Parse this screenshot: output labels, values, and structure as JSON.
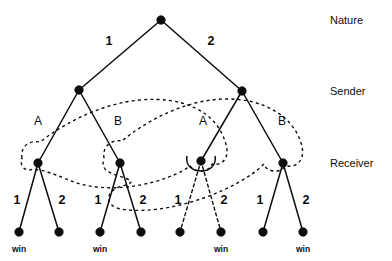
{
  "figure": {
    "type": "extensive-form-game-tree",
    "title": "",
    "background_color": "#ffffff",
    "line_color": "#0d0d0d"
  },
  "role_labels": [
    {
      "name": "nature",
      "text": "Nature",
      "x": 330,
      "y": 21
    },
    {
      "name": "sender",
      "text": "Sender",
      "x": 330,
      "y": 92
    },
    {
      "name": "receiver",
      "text": "Receiver",
      "x": 330,
      "y": 164
    }
  ],
  "nodes": {
    "root": {
      "id": "root",
      "label": "",
      "x": 161,
      "y": 20,
      "player": "Nature"
    },
    "sender": [
      {
        "id": "s1",
        "label": "",
        "x": 79,
        "y": 90,
        "player": "Sender"
      },
      {
        "id": "s2",
        "label": "",
        "x": 242,
        "y": 91,
        "player": "Sender"
      }
    ],
    "receiver": [
      {
        "id": "r1",
        "label": "",
        "x": 38,
        "y": 163,
        "player": "Receiver"
      },
      {
        "id": "r2",
        "label": "",
        "x": 120,
        "y": 163,
        "player": "Receiver"
      },
      {
        "id": "r3",
        "label": "",
        "x": 201,
        "y": 161,
        "player": "Receiver"
      },
      {
        "id": "r4",
        "label": "",
        "x": 283,
        "y": 163,
        "player": "Receiver"
      }
    ],
    "terminal": [
      {
        "id": "t1",
        "x": 19,
        "y": 232,
        "outcome": "win"
      },
      {
        "id": "t2",
        "x": 59,
        "y": 232,
        "outcome": ""
      },
      {
        "id": "t3",
        "x": 100,
        "y": 232,
        "outcome": "win"
      },
      {
        "id": "t4",
        "x": 141,
        "y": 232,
        "outcome": ""
      },
      {
        "id": "t5",
        "x": 180,
        "y": 232,
        "outcome": ""
      },
      {
        "id": "t6",
        "x": 221,
        "y": 232,
        "outcome": "win"
      },
      {
        "id": "t7",
        "x": 263,
        "y": 232,
        "outcome": ""
      },
      {
        "id": "t8",
        "x": 303,
        "y": 232,
        "outcome": "win"
      }
    ]
  },
  "nature_moves": [
    {
      "name": "nature-move-1",
      "label": "1",
      "from": "root",
      "to": "s1",
      "label_x": 109,
      "label_y": 45
    },
    {
      "name": "nature-move-2",
      "label": "2",
      "from": "root",
      "to": "s2",
      "label_x": 211,
      "label_y": 45
    }
  ],
  "sender_messages": [
    {
      "name": "sender-message-a-left",
      "label": "A",
      "from": "s1",
      "to": "r1",
      "label_x": 38,
      "label_y": 121
    },
    {
      "name": "sender-message-b-left",
      "label": "B",
      "from": "s1",
      "to": "r2",
      "label_x": 118,
      "label_y": 121
    },
    {
      "name": "sender-message-a-right",
      "label": "A",
      "from": "s2",
      "to": "r3",
      "label_x": 203,
      "label_y": 121
    },
    {
      "name": "sender-message-b-right",
      "label": "B",
      "from": "s2",
      "to": "r4",
      "label_x": 282,
      "label_y": 121
    }
  ],
  "receiver_actions": [
    {
      "name": "receiver-action-r1-1",
      "label": "1",
      "from": "r1",
      "to": "t1",
      "label_x": 17,
      "label_y": 200
    },
    {
      "name": "receiver-action-r1-2",
      "label": "2",
      "from": "r1",
      "to": "t2",
      "label_x": 62,
      "label_y": 200
    },
    {
      "name": "receiver-action-r2-1",
      "label": "1",
      "from": "r2",
      "to": "t3",
      "label_x": 98,
      "label_y": 200
    },
    {
      "name": "receiver-action-r2-2",
      "label": "2",
      "from": "r2",
      "to": "t4",
      "label_x": 143,
      "label_y": 200
    },
    {
      "name": "receiver-action-r3-1",
      "label": "1",
      "from": "r3",
      "to": "t5",
      "label_x": 178,
      "label_y": 200
    },
    {
      "name": "receiver-action-r3-2",
      "label": "2",
      "from": "r3",
      "to": "t6",
      "label_x": 224,
      "label_y": 200
    },
    {
      "name": "receiver-action-r4-1",
      "label": "1",
      "from": "r4",
      "to": "t7",
      "label_x": 260,
      "label_y": 200
    },
    {
      "name": "receiver-action-r4-2",
      "label": "2",
      "from": "r4",
      "to": "t8",
      "label_x": 306,
      "label_y": 200
    }
  ],
  "outcome_labels": [
    {
      "name": "outcome-win-1",
      "text": "win",
      "x": 19,
      "y": 250
    },
    {
      "name": "outcome-win-2",
      "text": "win",
      "x": 100,
      "y": 250
    },
    {
      "name": "outcome-win-3",
      "text": "win",
      "x": 221,
      "y": 250
    },
    {
      "name": "outcome-win-4",
      "text": "win",
      "x": 303,
      "y": 250
    }
  ],
  "information_sets": [
    {
      "name": "information-set-a",
      "members": [
        "r1",
        "r3"
      ],
      "style": "dashed"
    },
    {
      "name": "information-set-b",
      "members": [
        "r2",
        "r4"
      ],
      "style": "dashed"
    }
  ]
}
